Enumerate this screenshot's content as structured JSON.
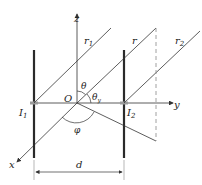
{
  "labels": {
    "z": "z",
    "y": "y",
    "x": "x",
    "origin": "O",
    "r1": "r",
    "r1_sub": "1",
    "r": "r",
    "r2": "r",
    "r2_sub": "2",
    "theta": "θ",
    "theta_y": "θ",
    "theta_y_sub": "y",
    "phi": "φ",
    "I1": "I",
    "I1_sub": "1",
    "I2": "I",
    "I2_sub": "2",
    "d": "d"
  },
  "colors": {
    "line": "#333333",
    "dipole": "#2a2a2a",
    "dashed": "#888888"
  }
}
